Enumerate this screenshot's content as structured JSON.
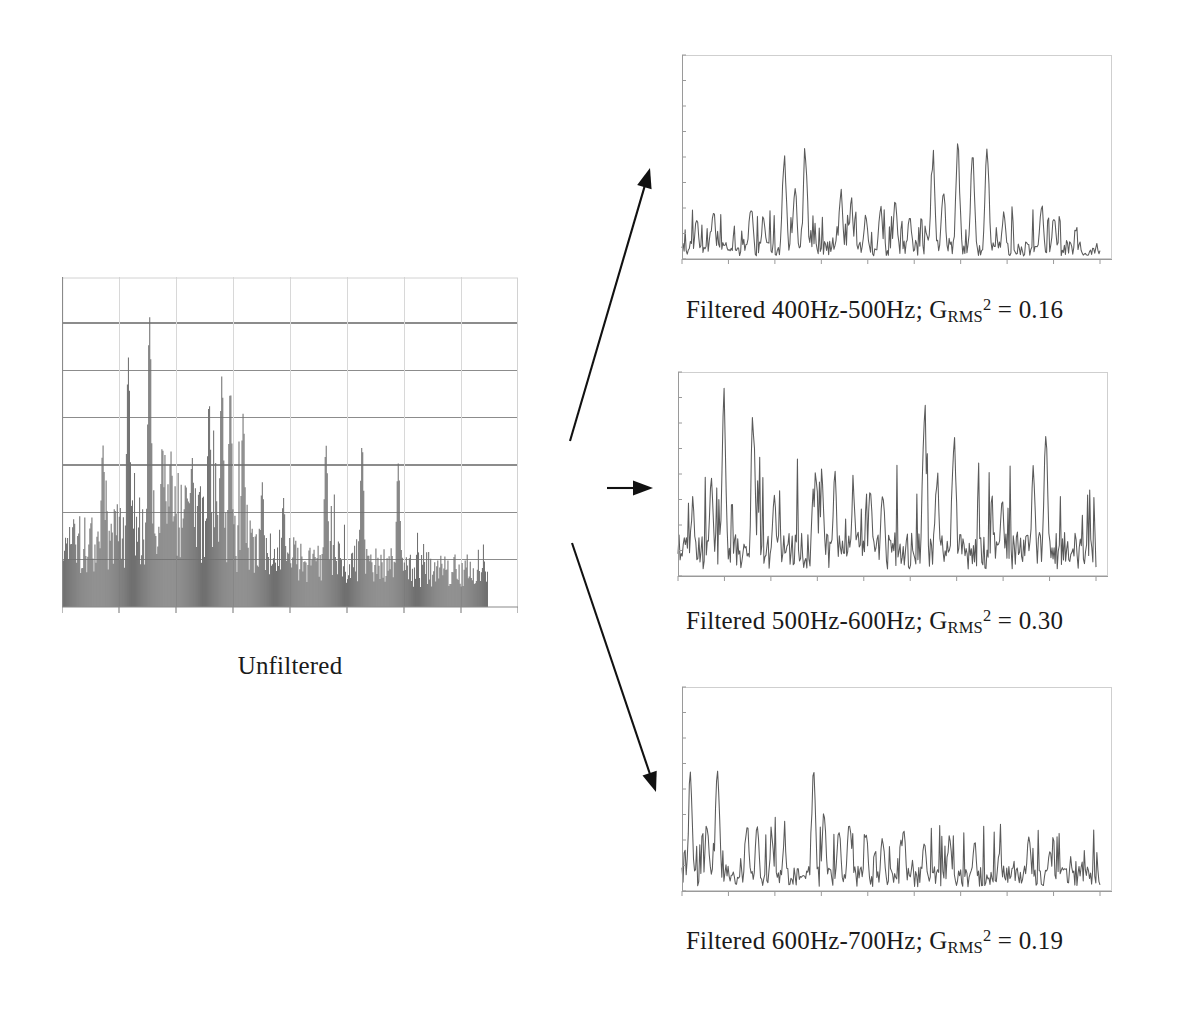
{
  "figure": {
    "type": "signal-filtering-comparison",
    "background": "#ffffff",
    "ink_color": "#1a1a1a",
    "signal_color": "#707070",
    "grid_color": "#8c8c8c",
    "frame_color": "#bdbdbd"
  },
  "unfiltered": {
    "label": "Unfiltered",
    "plot": {
      "style": "filled-spike-histogram",
      "fill_color": "#808080",
      "gridlines_horizontal": 6,
      "xticks": 8,
      "data_right_gap_px": 30
    }
  },
  "filtered": [
    {
      "caption_prefix": "Filtered ",
      "band": "400Hz-500Hz",
      "separator": "; ",
      "metric_symbol": "G",
      "metric_subscript": "RMS",
      "metric_superscript": "2",
      "equals": " = ",
      "value": "0.16",
      "caption_full": "Filtered 400Hz-500Hz; GRMS2 = 0.16",
      "plot": {
        "style": "line-spike",
        "density": 0.34,
        "peak_scale": 0.62
      }
    },
    {
      "caption_prefix": "Filtered ",
      "band": "500Hz-600Hz",
      "separator": "; ",
      "metric_symbol": "G",
      "metric_subscript": "RMS",
      "metric_superscript": "2",
      "equals": " = ",
      "value": "0.30",
      "caption_full": "Filtered 500Hz-600Hz; GRMS2 = 0.30",
      "plot": {
        "style": "line-spike",
        "density": 0.62,
        "peak_scale": 0.95
      }
    },
    {
      "caption_prefix": "Filtered ",
      "band": "600Hz-700Hz",
      "separator": "; ",
      "metric_symbol": "G",
      "metric_subscript": "RMS",
      "metric_superscript": "2",
      "equals": " = ",
      "value": "0.19",
      "caption_full": "Filtered 600Hz-700Hz; GRMS2 = 0.19",
      "plot": {
        "style": "line-spike",
        "density": 0.42,
        "peak_scale": 0.7
      }
    }
  ],
  "arrows": [
    {
      "name": "arrow-to-band1",
      "direction": "up-right",
      "x1": 570,
      "y1": 441,
      "x2": 650,
      "y2": 168
    },
    {
      "name": "arrow-to-band2",
      "direction": "right",
      "x1": 607,
      "y1": 488,
      "x2": 653,
      "y2": 488
    },
    {
      "name": "arrow-to-band3",
      "direction": "down-right",
      "x1": 572,
      "y1": 543,
      "x2": 656,
      "y2": 792
    }
  ],
  "chart_data": {
    "type": "line",
    "title": "",
    "panels": [
      {
        "name": "Unfiltered",
        "type": "area",
        "xlabel": "",
        "ylabel": "",
        "n_points": 420,
        "grid": true,
        "gridlines_y": 6,
        "description": "Dense broadband vibration time-history, amplitude decaying from left to right, tall isolated spikes reaching full scale.",
        "envelope": [
          0.52,
          0.58,
          0.64,
          0.72,
          0.8,
          0.74,
          0.62,
          0.52,
          0.46,
          0.42,
          0.4,
          0.38,
          0.36,
          0.34,
          0.33,
          0.32
        ],
        "peak_positions": [
          0.095,
          0.155,
          0.205,
          0.235,
          0.255,
          0.305,
          0.345,
          0.375,
          0.395,
          0.425,
          0.47,
          0.52,
          0.62,
          0.705,
          0.79
        ],
        "peak_heights": [
          0.52,
          0.8,
          0.93,
          0.52,
          0.5,
          0.48,
          0.66,
          0.74,
          0.7,
          0.62,
          0.4,
          0.35,
          0.52,
          0.52,
          0.46
        ]
      },
      {
        "name": "Filtered 400Hz-500Hz",
        "type": "line",
        "n_points": 400,
        "grid": false,
        "baseline": 0.06,
        "description": "Sparse narrowband bursts with low noise floor; two peak clusters near 25-33% and 62-78% of record.",
        "peak_positions": [
          0.035,
          0.075,
          0.165,
          0.195,
          0.245,
          0.27,
          0.295,
          0.38,
          0.405,
          0.44,
          0.475,
          0.51,
          0.545,
          0.6,
          0.625,
          0.66,
          0.695,
          0.73,
          0.77,
          0.86,
          0.89
        ],
        "peak_heights": [
          0.22,
          0.28,
          0.3,
          0.24,
          0.58,
          0.4,
          0.62,
          0.36,
          0.32,
          0.26,
          0.28,
          0.3,
          0.24,
          0.58,
          0.4,
          0.62,
          0.58,
          0.62,
          0.26,
          0.3,
          0.24
        ]
      },
      {
        "name": "Filtered 500Hz-600Hz",
        "type": "line",
        "n_points": 400,
        "grid": false,
        "baseline": 0.14,
        "description": "Dense high-energy band; highest noise floor and the tallest spikes of the three bands.",
        "peak_positions": [
          0.035,
          0.08,
          0.11,
          0.18,
          0.23,
          0.33,
          0.345,
          0.375,
          0.42,
          0.46,
          0.49,
          0.59,
          0.62,
          0.66,
          0.775,
          0.85,
          0.88
        ],
        "peak_heights": [
          0.4,
          0.56,
          0.96,
          0.88,
          0.42,
          0.56,
          0.5,
          0.54,
          0.44,
          0.46,
          0.5,
          0.92,
          0.58,
          0.8,
          0.42,
          0.56,
          0.78
        ]
      },
      {
        "name": "Filtered 600Hz-700Hz",
        "type": "line",
        "n_points": 400,
        "grid": false,
        "baseline": 0.08,
        "description": "Moderate energy decaying toward the right; peaks concentrated in the first half of the record.",
        "peak_positions": [
          0.02,
          0.06,
          0.085,
          0.155,
          0.18,
          0.215,
          0.245,
          0.315,
          0.34,
          0.375,
          0.4,
          0.44,
          0.48,
          0.53,
          0.58,
          0.64,
          0.7,
          0.76,
          0.83,
          0.88
        ],
        "peak_heights": [
          0.62,
          0.38,
          0.7,
          0.38,
          0.34,
          0.3,
          0.26,
          0.62,
          0.44,
          0.34,
          0.4,
          0.32,
          0.3,
          0.34,
          0.28,
          0.3,
          0.26,
          0.24,
          0.28,
          0.22
        ]
      }
    ],
    "legend": [],
    "annotations": [
      "Unfiltered",
      "Filtered 400Hz-500Hz; GRMS2 = 0.16",
      "Filtered 500Hz-600Hz; GRMS2 = 0.30",
      "Filtered 600Hz-700Hz; GRMS2 = 0.19"
    ]
  }
}
